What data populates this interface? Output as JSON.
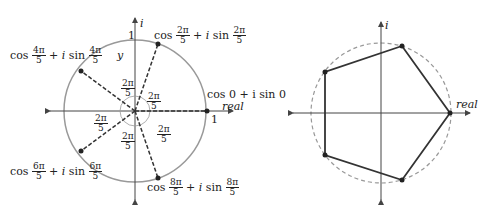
{
  "left_diagram": {
    "axis_imag_label": "i",
    "axis_real_label": "real",
    "unit_top_label": "1",
    "unit_right_label": "1",
    "y_label": "y",
    "points": [
      {
        "cos": "cos",
        "arg_num": "2π",
        "arg_den": "5",
        "plus_i": "+ i",
        "sin": "sin"
      },
      {
        "cos": "cos",
        "arg_num": "4π",
        "arg_den": "5",
        "plus_i": "+ i",
        "sin": "sin"
      },
      {
        "cos": "cos",
        "arg_num": "6π",
        "arg_den": "5",
        "plus_i": "+ i",
        "sin": "sin"
      },
      {
        "cos": "cos",
        "arg_num": "8π",
        "arg_den": "5",
        "plus_i": "+ i",
        "sin": "sin"
      }
    ],
    "point_zero_label_line1": "cos 0 + i sin 0",
    "angle_labels": [
      {
        "num": "2π",
        "den": "5"
      },
      {
        "num": "2π",
        "den": "5"
      },
      {
        "num": "2π",
        "den": "5"
      },
      {
        "num": "2π",
        "den": "5"
      },
      {
        "num": "2π",
        "den": "5"
      }
    ]
  },
  "right_diagram": {
    "axis_imag_label": "i",
    "axis_real_label": "real"
  },
  "colors": {
    "circle": "#999999",
    "lines": "#333333",
    "axes": "#444444"
  }
}
